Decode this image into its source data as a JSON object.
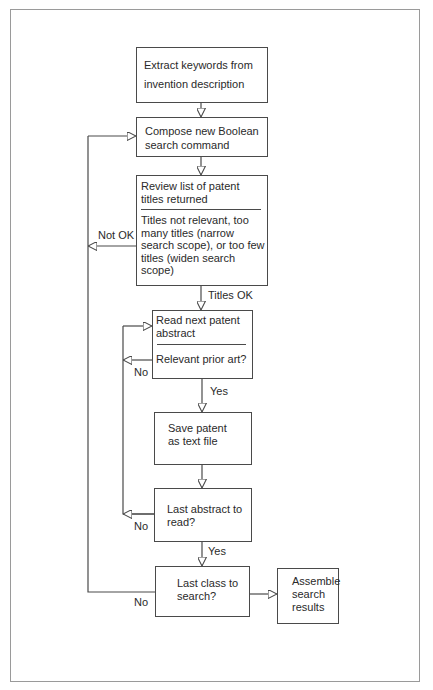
{
  "diagram": {
    "type": "flowchart",
    "title": "",
    "colors": {
      "line": "#4a4a4a",
      "frame": "#9a9a9a",
      "background": "#ffffff",
      "text": "#2a2a2a"
    },
    "nodes": {
      "extract": {
        "text": "Extract keywords from invention description"
      },
      "compose": {
        "text": "Compose new Boolean search command"
      },
      "review": {
        "top": "Review list of patent titles returned",
        "bottom": "Titles not relevant, too many titles (narrow search scope), or too few titles (widen search scope)"
      },
      "read": {
        "top": "Read next patent abstract",
        "bottom": "Relevant prior art?"
      },
      "save": {
        "text": "Save patent as text file"
      },
      "last_abstract": {
        "text": "Last abstract to read?"
      },
      "last_class": {
        "text": "Last class to search?"
      },
      "assemble": {
        "text": "Assemble search results"
      }
    },
    "edge_labels": {
      "not_ok": "Not OK",
      "titles_ok": "Titles OK",
      "no_relevant": "No",
      "yes_relevant": "Yes",
      "no_last_abstract": "No",
      "yes_last_abstract": "Yes",
      "no_last_class": "No"
    },
    "edges": [
      {
        "from": "extract",
        "to": "compose"
      },
      {
        "from": "compose",
        "to": "review"
      },
      {
        "from": "review",
        "to": "compose",
        "label": "Not OK"
      },
      {
        "from": "review",
        "to": "read",
        "label": "Titles OK"
      },
      {
        "from": "read",
        "to": "save",
        "label": "Yes"
      },
      {
        "from": "read",
        "to": "read",
        "label": "No"
      },
      {
        "from": "save",
        "to": "last_abstract"
      },
      {
        "from": "last_abstract",
        "to": "read",
        "label": "No"
      },
      {
        "from": "last_abstract",
        "to": "last_class",
        "label": "Yes"
      },
      {
        "from": "last_class",
        "to": "compose",
        "label": "No"
      },
      {
        "from": "last_class",
        "to": "assemble"
      }
    ]
  }
}
